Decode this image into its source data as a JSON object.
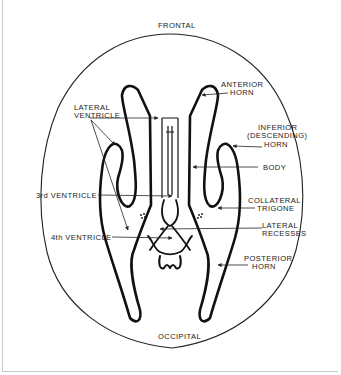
{
  "diagram": {
    "type": "anatomical-line-drawing",
    "orientation": {
      "top": "FRONTAL",
      "bottom": "OCCIPITAL"
    },
    "labels_left": [
      {
        "line1": "LATERAL",
        "line2": "VENTRICLE"
      },
      {
        "line1": "3rd VENTRICLE"
      },
      {
        "line1": "4th VENTRICLE"
      }
    ],
    "labels_right": [
      {
        "line1": "ANTERIOR",
        "line2": "HORN"
      },
      {
        "line1": "INFERIOR",
        "line2": "(DESCENDING)",
        "line3": "HORN"
      },
      {
        "line1": "BODY"
      },
      {
        "line1": "COLLATERAL",
        "line2": "TRIGONE"
      },
      {
        "line1": "LATERAL",
        "line2": "RECESSES"
      },
      {
        "line1": "POSTERIOR",
        "line2": "HORN"
      }
    ],
    "colors": {
      "line": "#111111",
      "text": "#222222",
      "background": "#ffffff",
      "frame": "#c8c8c8"
    }
  }
}
